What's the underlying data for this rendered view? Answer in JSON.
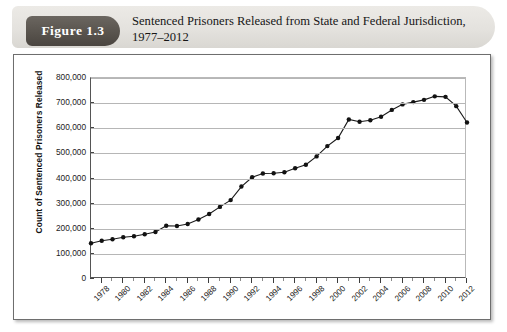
{
  "figure": {
    "badge_label": "Figure 1.3",
    "title_line1": "Sentenced Prisoners Released from State and Federal Jurisdiction,",
    "title_line2": "1977–2012"
  },
  "chart_data": {
    "type": "line",
    "title": "Sentenced Prisoners Released from State and Federal Jurisdiction, 1977–2012",
    "xlabel": "",
    "ylabel": "Count of Sentenced Prisoners Released",
    "ylim": [
      0,
      800000
    ],
    "ytick_labels": [
      "800,000",
      "700,000",
      "600,000",
      "500,000",
      "400,000",
      "300,000",
      "200,000",
      "100,000",
      "0"
    ],
    "ytick_values": [
      800000,
      700000,
      600000,
      500000,
      400000,
      300000,
      200000,
      100000,
      0
    ],
    "xtick_labels": [
      "1978",
      "1980",
      "1982",
      "1984",
      "1986",
      "1988",
      "1990",
      "1992",
      "1994",
      "1996",
      "1998",
      "2000",
      "2002",
      "2004",
      "2006",
      "2008",
      "2010",
      "2012"
    ],
    "xlim": [
      1977,
      2012
    ],
    "grid": "horizontal",
    "legend": "none",
    "marker": "filled-circle",
    "line_color": "#1a1a1a",
    "x": [
      1977,
      1978,
      1979,
      1980,
      1981,
      1982,
      1983,
      1984,
      1985,
      1986,
      1987,
      1988,
      1989,
      1990,
      1991,
      1992,
      1993,
      1994,
      1995,
      1996,
      1997,
      1998,
      1999,
      2000,
      2001,
      2002,
      2003,
      2004,
      2005,
      2006,
      2007,
      2008,
      2009,
      2010,
      2011,
      2012
    ],
    "values": [
      142000,
      152000,
      158000,
      166000,
      170000,
      178000,
      187000,
      212000,
      211000,
      219000,
      237000,
      259000,
      287000,
      314000,
      368000,
      405000,
      420000,
      421000,
      425000,
      441000,
      455000,
      488000,
      529000,
      561000,
      635000,
      626000,
      632000,
      646000,
      673000,
      695000,
      704000,
      713000,
      727000,
      725000,
      688000,
      623000
    ],
    "annotations": []
  }
}
